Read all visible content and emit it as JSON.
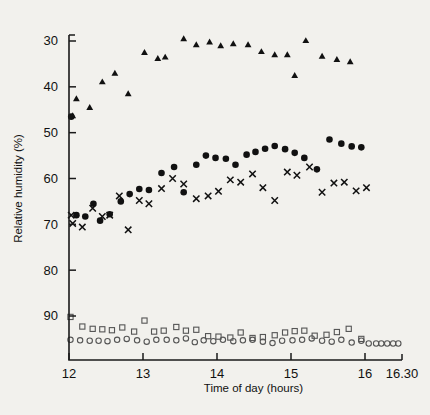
{
  "chart_data": {
    "type": "scatter",
    "title": "",
    "xlabel": "Time of day (hours)",
    "ylabel": "Relative humidity (%)",
    "xlim": [
      12.0,
      16.5
    ],
    "ylim": [
      30,
      97
    ],
    "y_inverted": true,
    "grid": false,
    "legend_position": "none",
    "x_ticks": [
      {
        "value": 12.0,
        "label": "12"
      },
      {
        "value": 13.0,
        "label": "13"
      },
      {
        "value": 14.0,
        "label": "14"
      },
      {
        "value": 15.0,
        "label": "15"
      },
      {
        "value": 16.0,
        "label": "16"
      },
      {
        "value": 16.5,
        "label": "16.30"
      }
    ],
    "y_ticks": [
      {
        "value": 30,
        "label": "30"
      },
      {
        "value": 40,
        "label": "40"
      },
      {
        "value": 50,
        "label": "50"
      },
      {
        "value": 60,
        "label": "60"
      },
      {
        "value": 70,
        "label": "70"
      },
      {
        "value": 80,
        "label": "80"
      },
      {
        "value": 90,
        "label": "90"
      }
    ],
    "series": [
      {
        "name": "filled-triangle",
        "marker": "triangle",
        "color": "#111111",
        "points": [
          [
            12.05,
            46.3
          ],
          [
            12.1,
            42.6
          ],
          [
            12.28,
            44.5
          ],
          [
            12.45,
            38.9
          ],
          [
            12.62,
            37.0
          ],
          [
            12.8,
            41.5
          ],
          [
            13.02,
            32.5
          ],
          [
            13.2,
            33.8
          ],
          [
            13.3,
            33.5
          ],
          [
            13.55,
            29.5
          ],
          [
            13.72,
            30.8
          ],
          [
            13.9,
            30.2
          ],
          [
            14.05,
            31.0
          ],
          [
            14.22,
            30.6
          ],
          [
            14.42,
            30.8
          ],
          [
            14.6,
            32.3
          ],
          [
            14.78,
            33.0
          ],
          [
            14.95,
            33.0
          ],
          [
            15.05,
            37.5
          ],
          [
            15.2,
            29.9
          ],
          [
            15.42,
            33.3
          ],
          [
            15.62,
            34.0
          ],
          [
            15.8,
            34.5
          ]
        ]
      },
      {
        "name": "filled-circle",
        "marker": "circle",
        "color": "#111111",
        "points": [
          [
            12.03,
            46.5
          ],
          [
            12.1,
            68.0
          ],
          [
            12.22,
            68.3
          ],
          [
            12.33,
            65.5
          ],
          [
            12.42,
            69.2
          ],
          [
            12.55,
            67.8
          ],
          [
            12.7,
            65.0
          ],
          [
            12.82,
            63.4
          ],
          [
            12.95,
            62.3
          ],
          [
            13.08,
            62.5
          ],
          [
            13.25,
            58.8
          ],
          [
            13.42,
            57.5
          ],
          [
            13.55,
            63.0
          ],
          [
            13.72,
            57.0
          ],
          [
            13.85,
            55.0
          ],
          [
            13.98,
            55.5
          ],
          [
            14.12,
            55.7
          ],
          [
            14.25,
            57.0
          ],
          [
            14.4,
            54.8
          ],
          [
            14.52,
            54.2
          ],
          [
            14.65,
            53.5
          ],
          [
            14.78,
            52.9
          ],
          [
            14.92,
            53.6
          ],
          [
            15.05,
            54.4
          ],
          [
            15.18,
            55.5
          ],
          [
            15.35,
            58.0
          ],
          [
            15.52,
            51.5
          ],
          [
            15.68,
            52.4
          ],
          [
            15.82,
            53.0
          ],
          [
            15.95,
            53.2
          ]
        ]
      },
      {
        "name": "cross",
        "marker": "cross",
        "color": "#111111",
        "points": [
          [
            12.03,
            68.0
          ],
          [
            12.05,
            69.8
          ],
          [
            12.18,
            70.6
          ],
          [
            12.32,
            66.5
          ],
          [
            12.45,
            68.3
          ],
          [
            12.55,
            68.0
          ],
          [
            12.68,
            63.8
          ],
          [
            12.8,
            71.2
          ],
          [
            12.95,
            64.8
          ],
          [
            13.08,
            65.5
          ],
          [
            13.25,
            62.2
          ],
          [
            13.4,
            60.0
          ],
          [
            13.55,
            61.2
          ],
          [
            13.72,
            64.4
          ],
          [
            13.88,
            63.8
          ],
          [
            14.02,
            62.8
          ],
          [
            14.18,
            60.3
          ],
          [
            14.32,
            60.8
          ],
          [
            14.48,
            59.0
          ],
          [
            14.62,
            62.0
          ],
          [
            14.78,
            64.8
          ],
          [
            14.95,
            58.6
          ],
          [
            15.08,
            59.3
          ],
          [
            15.25,
            57.5
          ],
          [
            15.42,
            63.0
          ],
          [
            15.58,
            61.0
          ],
          [
            15.72,
            60.8
          ],
          [
            15.88,
            62.7
          ],
          [
            16.02,
            62.0
          ]
        ]
      },
      {
        "name": "open-square",
        "marker": "square",
        "color": "#555555",
        "points": [
          [
            12.02,
            90.2
          ],
          [
            12.18,
            92.3
          ],
          [
            12.32,
            92.8
          ],
          [
            12.45,
            92.9
          ],
          [
            12.58,
            93.1
          ],
          [
            12.72,
            92.5
          ],
          [
            12.88,
            93.4
          ],
          [
            13.02,
            91.0
          ],
          [
            13.15,
            93.4
          ],
          [
            13.28,
            93.2
          ],
          [
            13.45,
            92.4
          ],
          [
            13.58,
            93.2
          ],
          [
            13.72,
            93.0
          ],
          [
            13.88,
            94.4
          ],
          [
            14.02,
            94.5
          ],
          [
            14.18,
            94.7
          ],
          [
            14.32,
            93.6
          ],
          [
            14.48,
            94.8
          ],
          [
            14.62,
            94.6
          ],
          [
            14.78,
            94.2
          ],
          [
            14.92,
            93.6
          ],
          [
            15.05,
            93.3
          ],
          [
            15.18,
            93.2
          ],
          [
            15.32,
            94.3
          ],
          [
            15.48,
            94.1
          ],
          [
            15.62,
            93.5
          ],
          [
            15.78,
            92.8
          ],
          [
            15.95,
            95.0
          ]
        ]
      },
      {
        "name": "open-circle",
        "marker": "open-circle",
        "color": "#555555",
        "points": [
          [
            12.02,
            95.2
          ],
          [
            12.15,
            95.3
          ],
          [
            12.28,
            95.4
          ],
          [
            12.4,
            95.4
          ],
          [
            12.52,
            95.5
          ],
          [
            12.65,
            95.2
          ],
          [
            12.78,
            95.0
          ],
          [
            12.92,
            95.3
          ],
          [
            13.05,
            95.6
          ],
          [
            13.18,
            95.2
          ],
          [
            13.32,
            95.2
          ],
          [
            13.45,
            95.3
          ],
          [
            13.58,
            94.9
          ],
          [
            13.7,
            95.7
          ],
          [
            13.82,
            95.3
          ],
          [
            13.95,
            95.5
          ],
          [
            14.08,
            95.2
          ],
          [
            14.22,
            95.5
          ],
          [
            14.35,
            95.3
          ],
          [
            14.48,
            95.2
          ],
          [
            14.62,
            95.6
          ],
          [
            14.75,
            95.9
          ],
          [
            14.88,
            95.4
          ],
          [
            15.02,
            95.3
          ],
          [
            15.15,
            95.2
          ],
          [
            15.28,
            94.9
          ],
          [
            15.42,
            95.4
          ],
          [
            15.55,
            95.6
          ],
          [
            15.68,
            95.2
          ],
          [
            15.82,
            95.8
          ],
          [
            15.95,
            95.4
          ],
          [
            16.05,
            96.0
          ],
          [
            16.15,
            96.0
          ],
          [
            16.22,
            96.0
          ],
          [
            16.3,
            96.0
          ],
          [
            16.38,
            96.0
          ],
          [
            16.45,
            96.0
          ]
        ]
      }
    ]
  }
}
